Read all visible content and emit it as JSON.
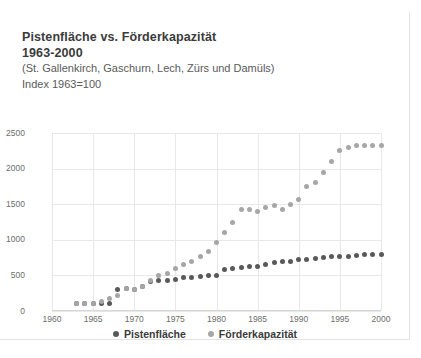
{
  "card": {
    "title_line1": "Pistenfläche vs. Förderkapazität",
    "title_line2": "1963-2000",
    "subtitle_line1": "(St. Gallenkirch, Gaschurn, Lech, Zürs und Damüls)",
    "subtitle_line2": "Index 1963=100"
  },
  "colors": {
    "series_dark": "#595959",
    "series_light": "#a6a6a6",
    "grid": "#e8e8e8",
    "axis_text": "#6d6d6d",
    "title_text": "#3b3b3b"
  },
  "chart_data": {
    "type": "scatter",
    "title": "Pistenfläche vs. Förderkapazität 1963-2000",
    "subtitle": "(St. Gallenkirch, Gaschurn, Lech, Zürs und Damüls) Index 1963=100",
    "xlabel": "",
    "ylabel": "",
    "xlim": [
      1960,
      2000
    ],
    "ylim": [
      0,
      2500
    ],
    "xticks": [
      1960,
      1965,
      1970,
      1975,
      1980,
      1985,
      1990,
      1995,
      2000
    ],
    "yticks": [
      0,
      500,
      1000,
      1500,
      2000,
      2500
    ],
    "grid": true,
    "legend_position": "bottom",
    "x": [
      1963,
      1964,
      1965,
      1966,
      1967,
      1968,
      1969,
      1970,
      1971,
      1972,
      1973,
      1974,
      1975,
      1976,
      1977,
      1978,
      1979,
      1980,
      1981,
      1982,
      1983,
      1984,
      1985,
      1986,
      1987,
      1988,
      1989,
      1990,
      1991,
      1992,
      1993,
      1994,
      1995,
      1996,
      1997,
      1998,
      1999,
      2000
    ],
    "series": [
      {
        "name": "Pistenfläche",
        "color": "#595959",
        "values": [
          100,
          100,
          100,
          100,
          100,
          300,
          310,
          300,
          350,
          410,
          430,
          430,
          440,
          470,
          470,
          480,
          500,
          500,
          580,
          600,
          610,
          620,
          620,
          650,
          680,
          690,
          700,
          720,
          730,
          740,
          750,
          760,
          770,
          770,
          780,
          790,
          790,
          790
        ]
      },
      {
        "name": "Förderkapazität",
        "color": "#a6a6a6",
        "values": [
          100,
          100,
          110,
          130,
          180,
          215,
          310,
          300,
          340,
          430,
          500,
          530,
          600,
          660,
          700,
          760,
          840,
          960,
          1100,
          1240,
          1420,
          1420,
          1400,
          1450,
          1480,
          1420,
          1500,
          1560,
          1750,
          1800,
          1950,
          2100,
          2250,
          2300,
          2330,
          2330,
          2330,
          2330
        ]
      }
    ]
  }
}
